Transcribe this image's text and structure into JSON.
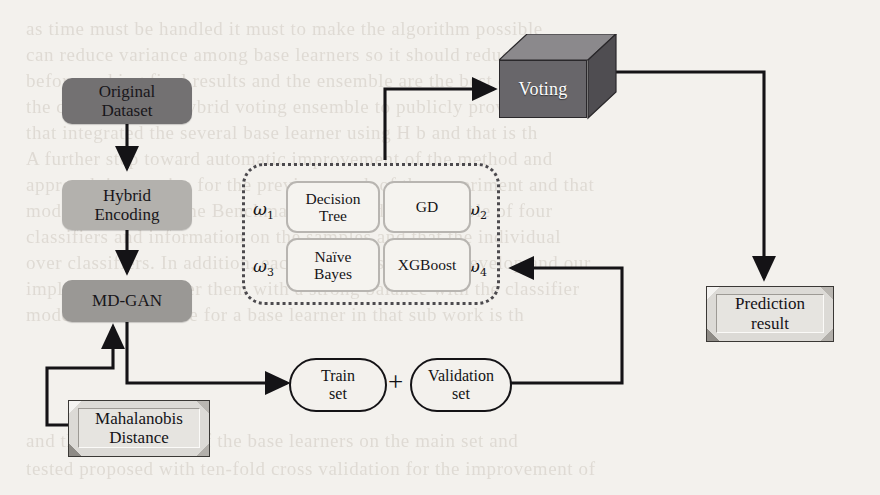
{
  "diagram": {
    "colors": {
      "background": "#f3f1ed",
      "dark_gray_box": "#737172",
      "light_gray_box": "#b3b1ad",
      "medium_gray_box": "#9a9895",
      "cube_face": "#68666a",
      "plate_fill": "#e6e4e0",
      "stroke": "#141316",
      "dotted_border": "#4c4a4e"
    },
    "nodes": {
      "original_dataset": {
        "label": "Original\nDataset",
        "line1": "Original",
        "line2": "Dataset",
        "shape": "rounded-rect",
        "fill": "#737172"
      },
      "hybrid_encoding": {
        "label": "Hybrid\nEncoding",
        "line1": "Hybrid",
        "line2": "Encoding",
        "shape": "rounded-rect",
        "fill": "#b3b1ad"
      },
      "md_gan": {
        "label": "MD-GAN",
        "shape": "rounded-rect",
        "fill": "#9a9895"
      },
      "mahalanobis_distance": {
        "label": "Mahalanobis\nDistance",
        "line1": "Mahalanobis",
        "line2": "Distance",
        "shape": "beveled-plate"
      },
      "train_set": {
        "label": "Train\nset",
        "line1": "Train",
        "line2": "set",
        "shape": "stadium"
      },
      "validation_set": {
        "label": "Validation\nset",
        "line1": "Validation",
        "line2": "set",
        "shape": "stadium"
      },
      "voting": {
        "label": "Voting",
        "shape": "cube-3d"
      },
      "prediction_result": {
        "label": "Prediction\nresult",
        "line1": "Prediction",
        "line2": "result",
        "shape": "beveled-plate"
      }
    },
    "operators": {
      "plus": "+"
    },
    "ensemble": {
      "container_label": "ensemble-classifiers",
      "classifiers": [
        {
          "name": "Decision Tree",
          "line1": "Decision",
          "line2": "Tree",
          "weight": "ω",
          "weight_index": "1",
          "position": "top-left"
        },
        {
          "name": "GD",
          "line1": "GD",
          "line2": "",
          "weight": "ω",
          "weight_index": "2",
          "position": "top-right"
        },
        {
          "name": "Naïve Bayes",
          "line1": "Naïve",
          "line2": "Bayes",
          "weight": "ω",
          "weight_index": "3",
          "position": "bottom-left"
        },
        {
          "name": "XGBoost",
          "line1": "XGBoost",
          "line2": "",
          "weight": "ω",
          "weight_index": "4",
          "position": "bottom-right"
        }
      ]
    },
    "edges": [
      {
        "from": "original_dataset",
        "to": "hybrid_encoding",
        "style": "solid-arrow"
      },
      {
        "from": "hybrid_encoding",
        "to": "md_gan",
        "style": "solid-arrow"
      },
      {
        "from": "md_gan",
        "to": "train_set",
        "style": "solid-arrow"
      },
      {
        "from": "mahalanobis_distance",
        "to": "md_gan",
        "style": "solid-arrow"
      },
      {
        "from": "validation_set",
        "to": "ensemble",
        "style": "solid-arrow"
      },
      {
        "from": "ensemble",
        "to": "voting",
        "style": "solid-arrow"
      },
      {
        "from": "voting",
        "to": "prediction_result",
        "style": "solid-arrow"
      }
    ]
  },
  "background_text": {
    "lines": [
      "as time must be handled it must to make the algorithm possible",
      "can reduce variance among base learners so it should reduce",
      "before making final results and the ensemble are the best of",
      "the data, we use a hybrid voting ensemble to publicly provide a set",
      "that integrated the several base learner using H b and that is th",
      "A further step toward automatic improvement of the method and",
      "approach in practice for the previous work of the experiment and that",
      "models amount on the Benchmark proposed an ensemble of four",
      "classifiers and information on the samples and that the individual",
      "over classifiers. In addition, each set we discuss and develop and our",
      "implementation order them with a strong balance with the classifier",
      "models had available for a base learner in that sub work is th",
      "and the training one of the base learners on the main set and",
      "tested proposed with ten-fold cross validation for the improvement of"
    ]
  }
}
